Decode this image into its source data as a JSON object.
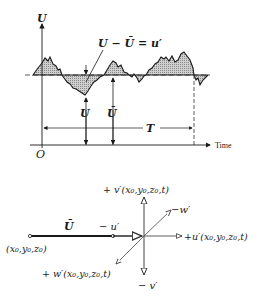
{
  "top_plot": {
    "y_axis_label": "U",
    "x_axis_label": "Time",
    "origin_label": "O",
    "fluctuation_label": "U − Ū = u′",
    "instant_label": "U",
    "mean_label": "Ū",
    "period_label": "T"
  },
  "bottom_diagram": {
    "origin_point_label": "(x₀,y₀,z₀)",
    "mean_velocity_label": "Ū",
    "neg_u_label": "− u′",
    "pos_u_label": "+u′(x₀,y₀,z₀,t)",
    "pos_v_label": "+ v′(x₀,y₀,z₀,t)",
    "neg_v_label": "− v′",
    "pos_w_label": "+ w′(x₀,y₀,z₀,t)",
    "neg_w_label": "−w′"
  },
  "colors": {
    "ink": "#1a1a1a",
    "hatch_fill": "#bdbdbd",
    "line": "#333333"
  }
}
